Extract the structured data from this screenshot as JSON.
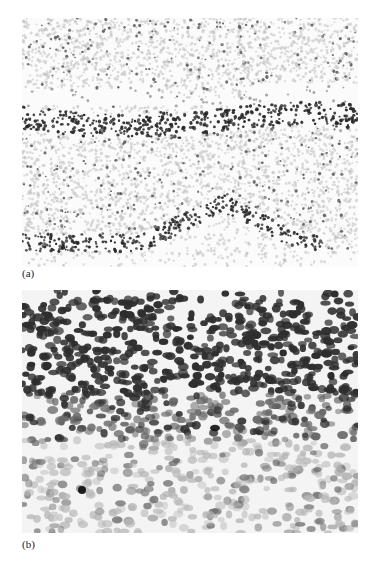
{
  "figure": {
    "panels": [
      {
        "id": "a",
        "label": "(a)",
        "description": "Low-magnification grayscale micrograph showing two dense dark cellular bands (a horizontal band across the middle and a wavy band at the bottom) separated by a lighter speckled region, with a sparsely speckled layer at top and a white cleft.",
        "colors": {
          "background": "#fbfbfb",
          "dense_band": "#2a2a2a",
          "speckle": "#555555",
          "light_speckle": "#bdbdbd"
        }
      },
      {
        "id": "b",
        "label": "(b)",
        "description": "Higher-magnification grayscale micrograph of densely packed dark oval nuclei in the upper half, grading into paler, more sparse nuclei toward the bottom.",
        "colors": {
          "background": "#f4f4f4",
          "dark_nuclei": "#2e2e2e",
          "mid_nuclei": "#6a6a6a",
          "pale_nuclei": "#b5b5b5"
        }
      }
    ]
  }
}
